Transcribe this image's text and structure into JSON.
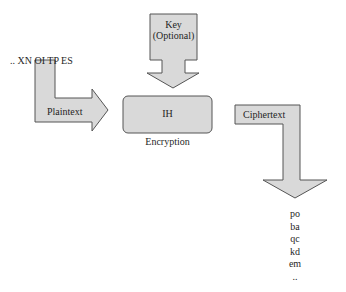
{
  "diagram": {
    "type": "encryption-flow",
    "colors": {
      "fill": "#d9d9d9",
      "stroke": "#555555",
      "background": "#ffffff"
    },
    "input_sequence": ".. XN OI TP ES",
    "key_arrow": {
      "line1": "Key",
      "line2": "(Optional)"
    },
    "plaintext_arrow": {
      "label": "Plaintext"
    },
    "process_box": {
      "label": "IH",
      "caption": "Encryption"
    },
    "ciphertext_arrow": {
      "label": "Ciphertext"
    },
    "output_sequence": [
      "po",
      "ba",
      "qc",
      "kd",
      "em",
      ".."
    ]
  }
}
